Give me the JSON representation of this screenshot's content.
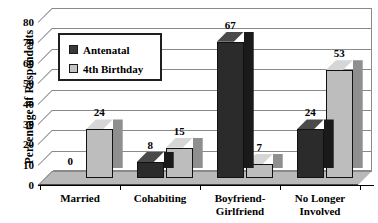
{
  "chart_data": {
    "type": "bar",
    "title": "",
    "xlabel": "",
    "ylabel": "Percentage of Respondents",
    "ylim": [
      0,
      80
    ],
    "ytick_step": 10,
    "yticks": [
      "0",
      "10",
      "20",
      "30",
      "40",
      "50",
      "60",
      "70",
      "80"
    ],
    "grid": true,
    "legend_position": "upper-left-inside",
    "categories": [
      "Married",
      "Cohabiting",
      "Boyfriend-Girlfriend",
      "No Longer Involved"
    ],
    "category_lines": [
      [
        "Married"
      ],
      [
        "Cohabiting"
      ],
      [
        "Boyfriend-",
        "Girlfriend"
      ],
      [
        "No Longer",
        "Involved"
      ]
    ],
    "series": [
      {
        "name": "Antenatal",
        "color": "#2b2b2b",
        "values": [
          0,
          8,
          67,
          24
        ],
        "labels": [
          "0",
          "8",
          "67",
          "24"
        ]
      },
      {
        "name": "4th Birthday",
        "color": "#bdbdbd",
        "values": [
          24,
          15,
          7,
          53
        ],
        "labels": [
          "24",
          "15",
          "7",
          "53"
        ]
      }
    ]
  },
  "legend": {
    "items": [
      {
        "label": "Antenatal",
        "swatch": "dark"
      },
      {
        "label": "4th Birthday",
        "swatch": "light"
      }
    ]
  },
  "axis": {
    "y_title": "Percentage of Respondents"
  }
}
